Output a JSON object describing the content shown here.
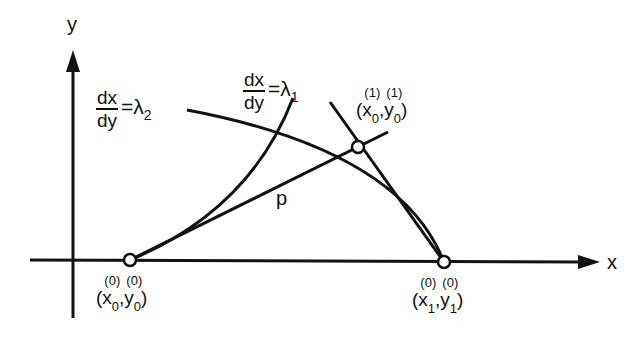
{
  "diagram": {
    "axes": {
      "x_label": "x",
      "y_label": "y"
    },
    "curves": {
      "lambda2": {
        "numerator": "dx",
        "denominator": "dy",
        "equals": "=λ",
        "subscript": "2"
      },
      "lambda1": {
        "numerator": "dx",
        "denominator": "dy",
        "equals": "=λ",
        "subscript": "1"
      },
      "chord_label": "p"
    },
    "points": {
      "p0": {
        "open": "(",
        "x": "x",
        "x_sub": "0",
        "x_sup": "(0)",
        "comma": ",",
        "y": "y",
        "y_sub": "0",
        "y_sup": "(0)",
        "close": ")"
      },
      "p1": {
        "open": "(",
        "x": "x",
        "x_sub": "1",
        "x_sup": "(0)",
        "comma": ",",
        "y": "y",
        "y_sub": "1",
        "y_sup": "(0)",
        "close": ")"
      },
      "p_new": {
        "open": "(",
        "x": "x",
        "x_sub": "0",
        "x_sup": "(1)",
        "comma": ",",
        "y": "y",
        "y_sub": "0",
        "y_sup": "(1)",
        "close": ")"
      }
    },
    "colors": {
      "stroke": "#111111",
      "background": "#ffffff"
    }
  }
}
